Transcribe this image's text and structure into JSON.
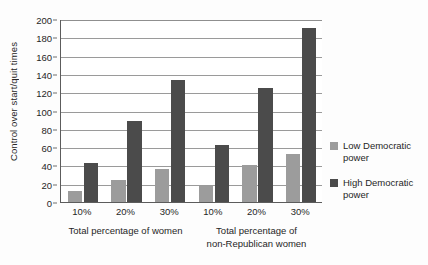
{
  "chart_data": {
    "type": "bar",
    "title": "",
    "xlabel": "",
    "ylabel": "Control over start/quit times",
    "ylim": [
      0,
      200
    ],
    "ytick_step": 20,
    "yticks": [
      200,
      180,
      160,
      140,
      120,
      100,
      80,
      60,
      40,
      20,
      0
    ],
    "grid": true,
    "legend_position": "right",
    "categories": [
      "10%",
      "20%",
      "30%",
      "10%",
      "20%",
      "30%"
    ],
    "groups": [
      {
        "caption": "Total percentage of women",
        "categories": [
          "10%",
          "20%",
          "30%"
        ]
      },
      {
        "caption": "Total percentage of\nnon-Republican women",
        "categories": [
          "10%",
          "20%",
          "30%"
        ]
      }
    ],
    "series": [
      {
        "name": "Low Democratic power",
        "color": "#9c9c9c",
        "values": [
          12,
          24,
          36,
          18,
          40,
          53
        ]
      },
      {
        "name": "High Democratic power",
        "color": "#4b4b4b",
        "values": [
          43,
          88,
          133,
          62,
          125,
          190
        ]
      }
    ]
  },
  "legend": {
    "entries": [
      {
        "label": "Low Democratic\npower",
        "swatch": "low-democratic-swatch"
      },
      {
        "label": "High Democratic\npower",
        "swatch": "high-democratic-swatch"
      }
    ]
  },
  "colors": {
    "low_series": "#9c9c9c",
    "high_series": "#4b4b4b",
    "axis": "#5c5c5c",
    "grid": "#9a9a9a",
    "text": "#262626",
    "background": "#ffffff"
  }
}
